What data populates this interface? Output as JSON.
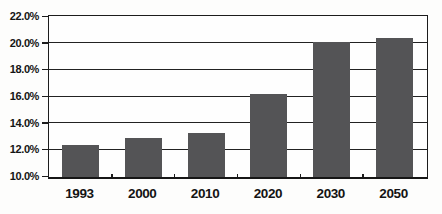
{
  "chart_data": {
    "type": "bar",
    "title": "",
    "categories": [
      "1993",
      "2000",
      "2010",
      "2020",
      "2030",
      "2050"
    ],
    "values": [
      12.4,
      12.9,
      13.3,
      16.2,
      20.1,
      20.4
    ],
    "xlabel": "",
    "ylabel": "",
    "ylim": [
      10.0,
      22.0
    ],
    "ytick_step": 2.0,
    "yticks": [
      10.0,
      12.0,
      14.0,
      16.0,
      18.0,
      20.0,
      22.0
    ],
    "ytick_labels": [
      "10.0%",
      "12.0%",
      "14.0%",
      "16.0%",
      "18.0%",
      "20.0%",
      "22.0%"
    ],
    "grid": true,
    "legend": false,
    "colors": {
      "bar": "#545456",
      "axis": "#1c1c1c",
      "text": "#141414",
      "background": "#fdfdfc"
    }
  }
}
